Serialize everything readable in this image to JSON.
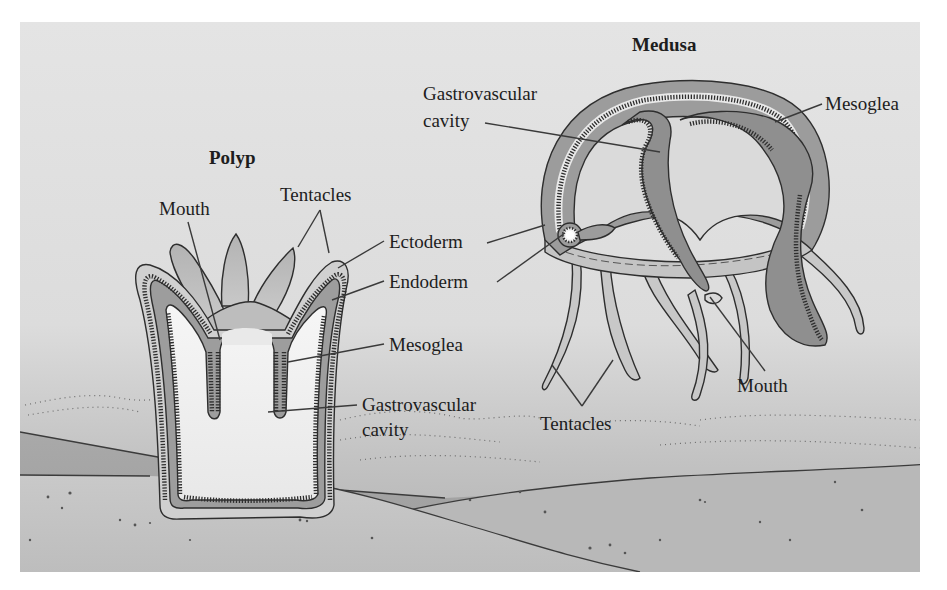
{
  "figure": {
    "colors": {
      "page_background": "#ffffff",
      "sky_top": "#e2e2e2",
      "sky_bottom": "#b9b9b9",
      "ground_light": "#c6c6c6",
      "ground_dark": "#a2a2a2",
      "ectoderm_dark": "#8e8e8e",
      "mesoglea_mid": "#a9a9a9",
      "tissue_light": "#cfcfcf",
      "cavity_white": "#f2f2f2"
    },
    "polyp": {
      "title": "Polyp",
      "labels": {
        "mouth": "Mouth",
        "tentacles": "Tentacles",
        "ectoderm": "Ectoderm",
        "endoderm": "Endoderm",
        "mesoglea": "Mesoglea",
        "gastrovascular_line1": "Gastrovascular",
        "gastrovascular_line2": "cavity"
      }
    },
    "medusa": {
      "title": "Medusa",
      "labels": {
        "gastrovascular_line1": "Gastrovascular",
        "gastrovascular_line2": "cavity",
        "mesoglea": "Mesoglea",
        "mouth": "Mouth",
        "tentacles": "Tentacles"
      }
    }
  }
}
